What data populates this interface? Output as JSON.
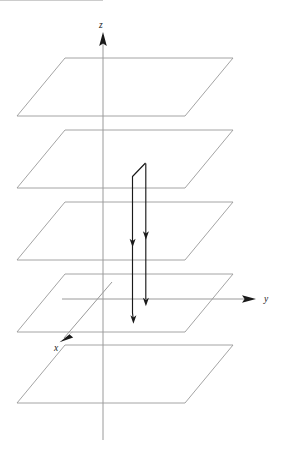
{
  "figure": {
    "background_color": "#ffffff",
    "width": 285,
    "height": 473
  },
  "axes": {
    "z": {
      "label": "z",
      "label_x": 99,
      "label_y": 28,
      "direction": "up",
      "line_x1": 103,
      "line_y1": 440,
      "line_x2": 103,
      "line_y2": 38,
      "arrow": "M103,32 L99.2,46 L103,43.4 L106.8,46 Z",
      "color": "#9a9a9a"
    },
    "y": {
      "label": "y",
      "label_x": 264,
      "label_y": 302,
      "direction": "right",
      "line_x1": 62,
      "line_y1": 299,
      "line_x2": 250,
      "line_y2": 299,
      "arrow": "M256,299 L242,295.2 L244.6,299 L242,302.8 Z",
      "color": "#9a9a9a"
    },
    "x": {
      "label": "x",
      "label_x": 54,
      "label_y": 351,
      "direction": "down-left",
      "line_x1": 112,
      "line_y1": 282,
      "line_x2": 64,
      "line_y2": 338,
      "arrow": "M59.5,342.2 L73.2,337.5 L69.6,334.4 L73.4,331.2 Z",
      "color": "#9a9a9a"
    }
  },
  "planes": {
    "count": 5,
    "color": "#9a9a9a",
    "shape": "parallelogram",
    "items": [
      {
        "name": "plane-1-top",
        "points": "65,58 233,58 185,116 17,116"
      },
      {
        "name": "plane-2",
        "points": "65,130 233,130 185,188 17,188"
      },
      {
        "name": "plane-3-middle",
        "points": "65,202 233,202 185,260 17,260"
      },
      {
        "name": "plane-4",
        "points": "65,274 233,274 185,332 17,332"
      },
      {
        "name": "plane-5-bottom",
        "points": "65,345 233,345 185,403 17,403"
      }
    ]
  },
  "trajectory": {
    "color": "#1a1a1a",
    "description": "Narrow vertical loop with downward direction arrowheads",
    "left_branch": "M145.5,163 L132.5,176.5 L132.5,313 L133.2,318.5",
    "right_branch": "M145.8,163.4 L145.8,299.5",
    "markers": [
      {
        "name": "arrowhead-left-mid",
        "x": 132.6,
        "y": 243.5,
        "rotation": 180
      },
      {
        "name": "arrowhead-right-mid",
        "x": 145.9,
        "y": 236.0,
        "rotation": 180
      },
      {
        "name": "arrowhead-right-lower",
        "x": 145.9,
        "y": 302.5,
        "rotation": 180
      },
      {
        "name": "arrowhead-left-lower",
        "x": 133.4,
        "y": 320.0,
        "rotation": 180
      }
    ]
  }
}
